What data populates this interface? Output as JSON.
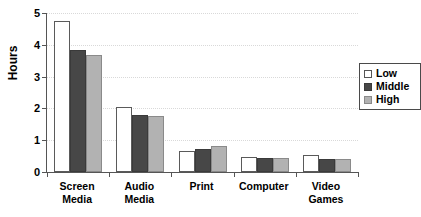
{
  "chart_data": {
    "type": "bar",
    "title": "",
    "xlabel": "",
    "ylabel": "Hours",
    "ylim": [
      0,
      5
    ],
    "yticks": [
      0,
      1,
      2,
      3,
      4,
      5
    ],
    "ytick_labels": [
      "0",
      "1",
      "2",
      "3",
      "4",
      "5"
    ],
    "grid": true,
    "legend_position": "right",
    "categories": [
      "Screen\nMedia",
      "Audio Media",
      "Print",
      "Computer",
      "Video\nGames"
    ],
    "series": [
      {
        "name": "Low",
        "color": "#ffffff",
        "values": [
          4.75,
          2.05,
          0.65,
          0.47,
          0.55
        ]
      },
      {
        "name": "Middle",
        "color": "#474747",
        "values": [
          3.85,
          1.8,
          0.72,
          0.45,
          0.4
        ]
      },
      {
        "name": "High",
        "color": "#b2b2b2",
        "values": [
          3.68,
          1.75,
          0.82,
          0.45,
          0.4
        ]
      }
    ]
  },
  "legend": {
    "items": [
      {
        "label": "Low"
      },
      {
        "label": "Middle"
      },
      {
        "label": "High"
      }
    ]
  }
}
